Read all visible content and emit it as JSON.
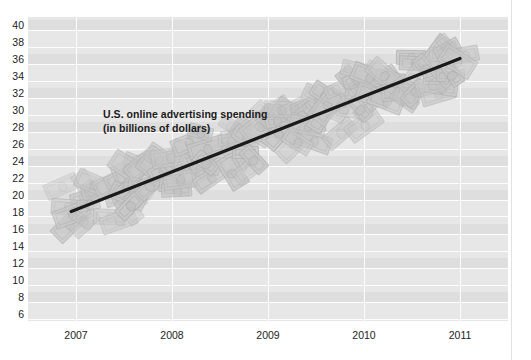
{
  "chart_data": {
    "type": "line",
    "title": "",
    "annotation": "U.S. online advertising spending\n(in billions of dollars)",
    "annotation_line1": "U.S. online advertising spending",
    "annotation_line2": "(in billions of dollars)",
    "xlabel": "",
    "ylabel": "",
    "ylim": [
      5,
      41
    ],
    "yticks": [
      40,
      38,
      36,
      34,
      32,
      30,
      28,
      26,
      24,
      22,
      20,
      18,
      16,
      14,
      12,
      10,
      8,
      6
    ],
    "ytick_labels": [
      "40",
      "38",
      "36",
      "34",
      "32",
      "30",
      "28",
      "26",
      "24",
      "22",
      "20",
      "18",
      "16",
      "14",
      "12",
      "10",
      "8",
      "6"
    ],
    "xticks": [
      2007,
      2008,
      2009,
      2010,
      2011
    ],
    "xtick_labels": [
      "2007",
      "2008",
      "2009",
      "2010",
      "2011"
    ],
    "grid": true,
    "legend": "none",
    "series": [
      {
        "name": "U.S. online advertising spending",
        "style": "trendline",
        "color": "#1a1a1a",
        "x": [
          2006.95,
          2011.0
        ],
        "values": [
          18.0,
          36.0
        ]
      }
    ],
    "data_points": [
      {
        "x": 2007,
        "y": 18.4
      },
      {
        "x": 2008,
        "y": 22.5
      },
      {
        "x": 2009,
        "y": 26.6
      },
      {
        "x": 2010,
        "y": 31.0
      },
      {
        "x": 2011,
        "y": 35.5
      }
    ],
    "background_motif": "overlapping-dollar-bills"
  },
  "colors": {
    "plot_background": "#e7e7e7",
    "band": "#dedede",
    "gridline": "#fdfdfd",
    "trend_line": "#1a1a1a",
    "text": "#1c1c1c",
    "bill_fill": "#c9c9c9",
    "bill_stroke": "#b3b3b3"
  }
}
